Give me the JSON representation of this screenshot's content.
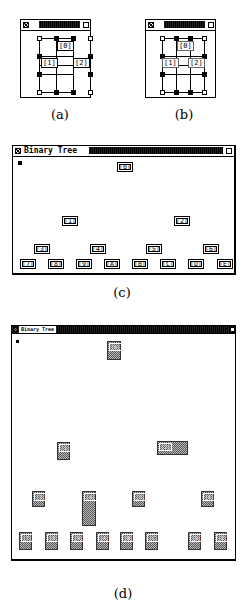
{
  "panels": {
    "a": {
      "caption": "(a)",
      "window": {
        "close_icon": "close-box-icon",
        "zoom_icon": "zoom-box-icon"
      },
      "labels": [
        "[0]",
        "[1]",
        "[2]"
      ]
    },
    "b": {
      "caption": "(b)",
      "window": {
        "close_icon": "close-box-icon",
        "zoom_icon": "zoom-box-icon"
      },
      "labels": [
        "[0]",
        "[1]",
        "[2]"
      ]
    },
    "c": {
      "caption": "(c)",
      "window": {
        "title": "Binary Tree",
        "close_icon": "close-box-icon",
        "zoom_icon": "zoom-box-icon"
      },
      "nodes": [
        "[0]",
        "[1]",
        "[2]",
        "[3]",
        "[4]",
        "[5]",
        "[6]",
        "[7]",
        "[8]",
        "[9]",
        "[A]",
        "[B]",
        "[C]",
        "[D]",
        "[E]"
      ]
    },
    "d": {
      "caption": "(d)",
      "window": {
        "title": "Binary Tree",
        "close_icon": "close-box-icon",
        "zoom_icon": "zoom-box-icon"
      },
      "nodes": [
        "[0]",
        "[1]",
        "[2]",
        "[3]",
        "[4]",
        "[5]",
        "[6]",
        "[7]",
        "[8]",
        "[9]",
        "[A]",
        "[B]",
        "[C]",
        "[D]",
        "[E]"
      ]
    }
  }
}
